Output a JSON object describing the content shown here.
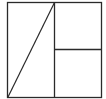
{
  "diagram": {
    "width": 106,
    "height": 99,
    "stroke_color": "#2a2a2a",
    "background": "#ffffff",
    "outer_square": {
      "x": 7.5,
      "y": 2.5,
      "w": 94,
      "h": 95
    },
    "vertical_divider": {
      "x1": 54.5,
      "y1": 2.5,
      "x2": 54.5,
      "y2": 97.5
    },
    "horizontal_divider": {
      "x1": 54.5,
      "y1": 49.5,
      "x2": 101.5,
      "y2": 49.5
    },
    "diagonal": {
      "x1": 8,
      "y1": 97,
      "x2": 54.5,
      "y2": 2.5
    }
  }
}
